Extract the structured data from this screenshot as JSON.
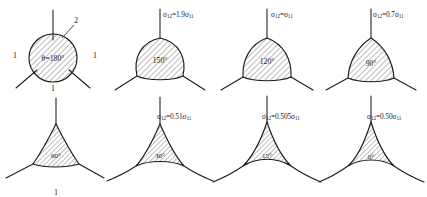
{
  "figure": {
    "axis_labels": {
      "grain_1": "1",
      "grain_2": "2",
      "grain_1_bottom": "1",
      "grain_1_right": "1",
      "grain_1_row2": "1"
    },
    "panels": [
      {
        "id": "panel-1",
        "shape": "circle",
        "angle_label": "θ=180°",
        "angle_deg": 180,
        "formula": null,
        "formula_ratio": null,
        "grain_labels": [
          "1",
          "2",
          "1",
          "1"
        ]
      },
      {
        "id": "panel-2",
        "shape": "lens-wide",
        "angle_label": "150°",
        "angle_deg": 150,
        "formula_sigma": "σ",
        "formula_sub_left": "12",
        "formula_eq": "=1.9",
        "formula_sub_right": "11",
        "formula_ratio": 1.9,
        "formula_text": "σ12=1.9σ11"
      },
      {
        "id": "panel-3",
        "shape": "rounded-triangle",
        "angle_label": "120°",
        "angle_deg": 120,
        "formula_sigma": "σ",
        "formula_sub_left": "12",
        "formula_eq": "=",
        "formula_sub_right": "11",
        "formula_ratio": 1.0,
        "formula_text": "σ12=σ11"
      },
      {
        "id": "panel-4",
        "shape": "rounded-triangle",
        "angle_label": "90°",
        "angle_deg": 90,
        "formula_sigma": "σ",
        "formula_sub_left": "12",
        "formula_eq": "=0.7",
        "formula_sub_right": "11",
        "formula_ratio": 0.7,
        "formula_text": "σ12=0.7σ11"
      },
      {
        "id": "panel-5",
        "shape": "triangle",
        "angle_label": "60°",
        "angle_deg": 60,
        "formula_sigma": "σ",
        "formula_sub_left": "12",
        "formula_eq": "=0.57",
        "formula_sub_right": "11",
        "formula_ratio": 0.57,
        "formula_text": "σ12=0.57σ11"
      },
      {
        "id": "panel-6",
        "shape": "concave-triangle",
        "angle_label": "30°",
        "angle_deg": 30,
        "formula_sigma": "σ",
        "formula_sub_left": "12",
        "formula_eq": "=0.51",
        "formula_sub_right": "11",
        "formula_ratio": 0.51,
        "formula_text": "σ12=0.51σ11"
      },
      {
        "id": "panel-7",
        "shape": "concave-triangle",
        "angle_label": "15°",
        "angle_deg": 15,
        "formula_sigma": "σ",
        "formula_sub_left": "12",
        "formula_eq": "=0.505",
        "formula_sub_right": "11",
        "formula_ratio": 0.505,
        "formula_text": "σ12=0.505σ11"
      },
      {
        "id": "panel-8",
        "shape": "concave-triangle-cusp",
        "angle_label": "0°",
        "angle_deg": 0,
        "formula_sigma": "σ",
        "formula_sub_left": "12",
        "formula_eq": "=0.50",
        "formula_sub_right": "11",
        "formula_ratio": 0.5,
        "formula_text": "σ12=0.50σ11"
      }
    ],
    "colors": {
      "line": "#1a1a1a",
      "hatch": "#4a4a4a",
      "background": "#ffffff"
    }
  }
}
